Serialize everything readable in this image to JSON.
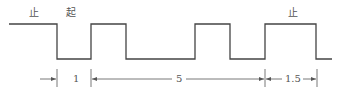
{
  "diagram": {
    "type": "serial-frame-timing",
    "labels": {
      "stop_left": "止",
      "start": "起",
      "stop_right": "止"
    },
    "dimensions": {
      "start_bit": "1",
      "data_bits": "5",
      "stop_bits": "1.5"
    },
    "colors": {
      "line": "#444444",
      "text": "#555555"
    }
  }
}
